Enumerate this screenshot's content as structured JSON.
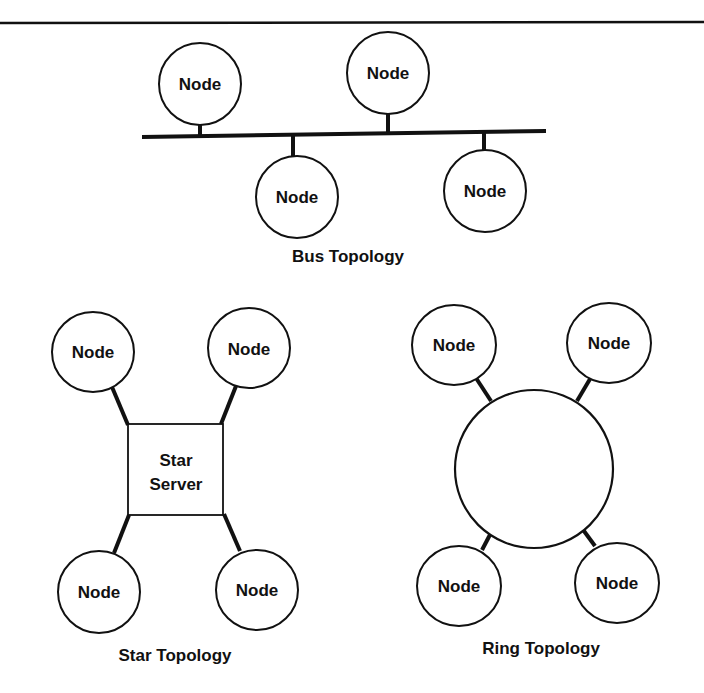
{
  "figure": {
    "top_rule": true,
    "node_label": "Node",
    "bus": {
      "caption": "Bus Topology",
      "nodes": [
        {
          "label": "Node",
          "position": "top-left"
        },
        {
          "label": "Node",
          "position": "top-middle"
        },
        {
          "label": "Node",
          "position": "bottom-left"
        },
        {
          "label": "Node",
          "position": "bottom-right"
        }
      ]
    },
    "star": {
      "caption": "Star Topology",
      "server_line1": "Star",
      "server_line2": "Server",
      "nodes": [
        {
          "label": "Node",
          "position": "top-left"
        },
        {
          "label": "Node",
          "position": "top-right"
        },
        {
          "label": "Node",
          "position": "bottom-left"
        },
        {
          "label": "Node",
          "position": "bottom-right"
        }
      ]
    },
    "ring": {
      "caption": "Ring Topology",
      "nodes": [
        {
          "label": "Node",
          "position": "top-left"
        },
        {
          "label": "Node",
          "position": "top-right"
        },
        {
          "label": "Node",
          "position": "bottom-left"
        },
        {
          "label": "Node",
          "position": "bottom-right"
        }
      ]
    }
  },
  "colors": {
    "ink": "#111111",
    "paper": "#ffffff"
  }
}
